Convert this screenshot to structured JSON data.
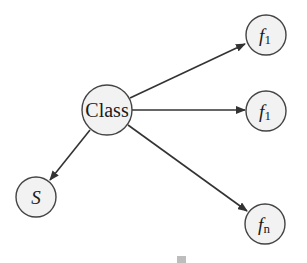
{
  "diagram": {
    "type": "directed-graph",
    "colors": {
      "node_fill": "#f2f2f2",
      "node_stroke": "#444444",
      "edge": "#333333",
      "text": "#1a1a1a"
    },
    "nodes": [
      {
        "id": "class",
        "label": "Class",
        "italic": false,
        "base": "Class",
        "sub": ""
      },
      {
        "id": "f1_top",
        "label": "f1",
        "italic": true,
        "base": "f",
        "sub": "1"
      },
      {
        "id": "f1_mid",
        "label": "f1",
        "italic": true,
        "base": "f",
        "sub": "1"
      },
      {
        "id": "fn",
        "label": "fn",
        "italic": true,
        "base": "f",
        "sub": "n"
      },
      {
        "id": "s",
        "label": "S",
        "italic": true,
        "base": "S",
        "sub": ""
      }
    ],
    "edges": [
      {
        "from": "class",
        "to": "f1_top"
      },
      {
        "from": "class",
        "to": "f1_mid"
      },
      {
        "from": "class",
        "to": "fn"
      },
      {
        "from": "class",
        "to": "s"
      }
    ]
  }
}
